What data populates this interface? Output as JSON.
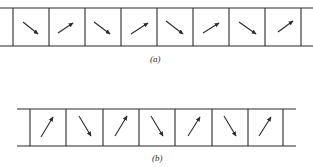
{
  "figure": {
    "panels": [
      {
        "label": "(a)",
        "description": "Row of cells with arrows alternating down-right and up-right",
        "cells": [
          "down-right",
          "up-right",
          "down-right",
          "up-right",
          "down-right",
          "up-right",
          "down-right",
          "up-right"
        ],
        "line_color": "#2a2a2a"
      },
      {
        "label": "(b)",
        "description": "Row of cells with arrows alternating up-right steep and down-right steep",
        "cells": [
          "up-steep",
          "down-steep",
          "up-steep",
          "down-steep",
          "up-steep",
          "down-steep",
          "up-steep"
        ],
        "line_color": "#2a2a2a"
      }
    ]
  }
}
